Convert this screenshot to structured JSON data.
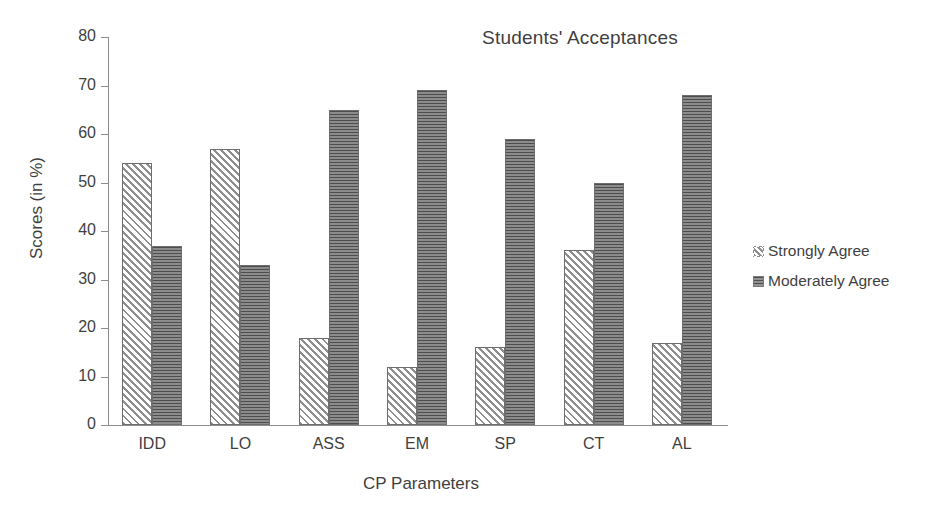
{
  "chart_data": {
    "type": "bar",
    "title": "Students' Acceptances",
    "xlabel": "CP Parameters",
    "ylabel": "Scores (in %)",
    "categories": [
      "IDD",
      "LO",
      "ASS",
      "EM",
      "SP",
      "CT",
      "AL"
    ],
    "series": [
      {
        "name": "Strongly Agree",
        "values": [
          54,
          57,
          18,
          12,
          16,
          36,
          17
        ]
      },
      {
        "name": "Moderately Agree",
        "values": [
          37,
          33,
          65,
          69,
          59,
          50,
          68
        ]
      }
    ],
    "ylim": [
      0,
      80
    ],
    "ytick_labels": [
      "0",
      "10",
      "20",
      "30",
      "40",
      "50",
      "60",
      "70",
      "80"
    ],
    "ytick_values": [
      0,
      10,
      20,
      30,
      40,
      50,
      60,
      70,
      80
    ],
    "grid": false,
    "legend_position": "right",
    "colors": {
      "strongly_agree": "#8e8e8e",
      "moderately_agree": "#6f6f6f",
      "axis": "#8c8c8c",
      "text": "#3f3f3f",
      "background": "#ffffff"
    },
    "patterns": {
      "strongly_agree": "diagonal-hatch",
      "moderately_agree": "horizontal-lines"
    }
  },
  "legend": {
    "entries": [
      {
        "label": "Strongly Agree"
      },
      {
        "label": "Moderately Agree"
      }
    ]
  }
}
